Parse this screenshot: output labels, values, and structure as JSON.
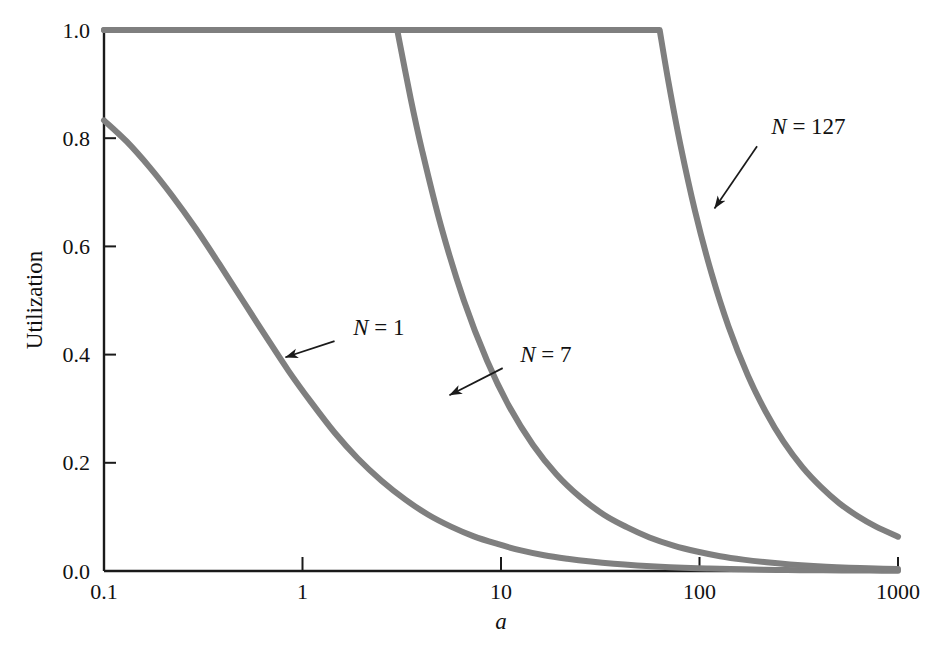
{
  "chart_data": {
    "type": "line",
    "title": "",
    "subtitle": "",
    "xlabel": "a",
    "ylabel": "Utilization",
    "xscale": "log",
    "xlim": [
      0.1,
      1000
    ],
    "ylim": [
      0.0,
      1.0
    ],
    "grid": false,
    "legend_position": "inline-annotations",
    "x_ticks": [
      {
        "value": 0.1,
        "label": "0.1"
      },
      {
        "value": 1,
        "label": "1"
      },
      {
        "value": 10,
        "label": "10"
      },
      {
        "value": 100,
        "label": "100"
      },
      {
        "value": 1000,
        "label": "1000"
      }
    ],
    "y_ticks": [
      {
        "value": 0.0,
        "label": "0.0"
      },
      {
        "value": 0.2,
        "label": "0.2"
      },
      {
        "value": 0.4,
        "label": "0.4"
      },
      {
        "value": 0.6,
        "label": "0.6"
      },
      {
        "value": 0.8,
        "label": "0.8"
      },
      {
        "value": 1.0,
        "label": "1.0"
      }
    ],
    "series": [
      {
        "name": "N = 1",
        "n": 1,
        "label_sym": "N",
        "label_rest": " = 1",
        "color": "#7f7f7f",
        "label_x": 1.8,
        "label_y": 0.45,
        "arrow_from_x": 1.45,
        "arrow_from_y": 0.425,
        "arrow_to_x": 0.82,
        "arrow_to_y": 0.395,
        "x": [
          0.1,
          0.13,
          0.17,
          0.22,
          0.29,
          0.38,
          0.5,
          0.65,
          0.85,
          1.1,
          1.45,
          1.9,
          2.5,
          3.3,
          4.3,
          5.6,
          7.3,
          9.6,
          12.6,
          16.5,
          21.6,
          28.3,
          37,
          48.5,
          63.5,
          83,
          109,
          143,
          187,
          245,
          320,
          420,
          550,
          720,
          1000
        ],
        "y": [
          0.833,
          0.794,
          0.746,
          0.694,
          0.633,
          0.568,
          0.5,
          0.435,
          0.37,
          0.313,
          0.256,
          0.208,
          0.167,
          0.132,
          0.104,
          0.082,
          0.064,
          0.05,
          0.038,
          0.029,
          0.0226,
          0.0174,
          0.0133,
          0.0102,
          0.0078,
          0.006,
          0.0046,
          0.0035,
          0.0027,
          0.002,
          0.0016,
          0.0012,
          0.0009,
          0.0007,
          0.0005
        ]
      },
      {
        "name": "N = 7",
        "n": 7,
        "label_sym": "N",
        "label_rest": " = 7",
        "color": "#7f7f7f",
        "label_x": 12.5,
        "label_y": 0.4,
        "arrow_from_x": 10.2,
        "arrow_from_y": 0.375,
        "arrow_to_x": 5.5,
        "arrow_to_y": 0.325,
        "saturation_x": 3.0,
        "x": [
          0.1,
          0.3,
          1,
          2,
          3,
          3.5,
          4,
          5,
          6.5,
          8.5,
          11,
          14.5,
          19,
          25,
          33,
          43,
          56,
          74,
          97,
          127,
          166,
          218,
          286,
          375,
          492,
          645,
          846,
          1000
        ],
        "y": [
          1.0,
          1.0,
          1.0,
          1.0,
          1.0,
          0.875,
          0.778,
          0.636,
          0.5,
          0.389,
          0.304,
          0.233,
          0.179,
          0.137,
          0.104,
          0.081,
          0.062,
          0.047,
          0.036,
          0.0274,
          0.021,
          0.016,
          0.0122,
          0.0093,
          0.0071,
          0.0054,
          0.0041,
          0.0035
        ]
      },
      {
        "name": "N = 127",
        "n": 127,
        "label_sym": "N",
        "label_rest": " = 127",
        "color": "#7f7f7f",
        "label_x": 230,
        "label_y": 0.82,
        "arrow_from_x": 195,
        "arrow_from_y": 0.785,
        "arrow_to_x": 119,
        "arrow_to_y": 0.67,
        "saturation_x": 63,
        "x": [
          0.1,
          1,
          10,
          40,
          63,
          70,
          80,
          95,
          115,
          140,
          175,
          215,
          265,
          330,
          410,
          505,
          625,
          775,
          1000
        ],
        "y": [
          1.0,
          1.0,
          1.0,
          1.0,
          1.0,
          0.901,
          0.789,
          0.665,
          0.55,
          0.452,
          0.362,
          0.295,
          0.239,
          0.192,
          0.155,
          0.1256,
          0.1016,
          0.0819,
          0.0635
        ]
      }
    ],
    "formula_note": "U = min(1, N/(1+2a))"
  },
  "axes": {
    "y_axis_title": "Utilization",
    "x_axis_title": "a",
    "axis_color": "#1a1a1a",
    "curve_color": "#7f7f7f"
  }
}
